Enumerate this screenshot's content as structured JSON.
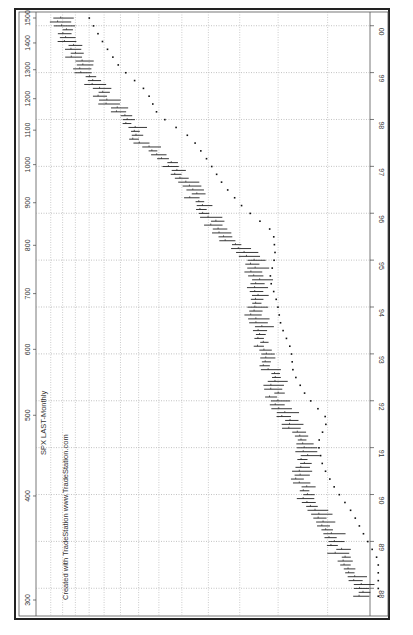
{
  "chart_data": {
    "type": "bar",
    "subtype": "ohlc-monthly",
    "title": "SPX LAST-Monthly",
    "subtitle": "Created with TradeStation  www.TradeStation.com",
    "orientation": "rotated-90",
    "price_axis": {
      "scale": "log",
      "tick_labels": [
        "1500",
        "1400",
        "1300",
        "1200",
        "1100",
        "1000",
        "900",
        "800",
        "700",
        "600",
        "500",
        "400",
        "300"
      ],
      "ticks": [
        1500,
        1400,
        1300,
        1200,
        1100,
        1000,
        900,
        800,
        700,
        600,
        500,
        400,
        300
      ],
      "range": [
        240,
        1560
      ]
    },
    "time_axis": {
      "tick_labels": [
        "00",
        "99",
        "98",
        "97",
        "96",
        "95",
        "94",
        "93",
        "92",
        "91",
        "90",
        "89",
        "88"
      ],
      "range": [
        "1987-10",
        "2000-03"
      ]
    },
    "grid": true,
    "x": [
      "1988",
      "1988.5",
      "1989",
      "1989.5",
      "1990",
      "1990.5",
      "1991",
      "1991.5",
      "1992",
      "1992.5",
      "1993",
      "1993.5",
      "1994",
      "1994.5",
      "1995",
      "1995.5",
      "1996",
      "1996.5",
      "1997",
      "1997.5",
      "1998",
      "1998.5",
      "1999",
      "1999.5",
      "2000"
    ],
    "series": [
      {
        "name": "SPX monthly close (approx.)",
        "values": [
          250,
          270,
          290,
          320,
          345,
          355,
          335,
          380,
          410,
          415,
          440,
          450,
          470,
          455,
          460,
          545,
          615,
          670,
          740,
          900,
          960,
          1120,
          1230,
          1330,
          1420
        ]
      }
    ]
  },
  "labels": {
    "title": "SPX LAST-Monthly",
    "credit": "Created with TradeStation  www.TradeStation.com"
  }
}
